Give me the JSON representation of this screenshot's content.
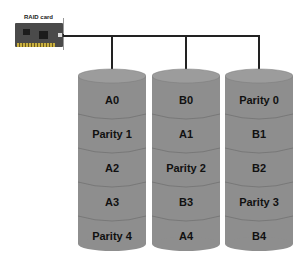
{
  "raid_card": {
    "label": "RAID card"
  },
  "colors": {
    "disk_fill": "#8e8e8e",
    "disk_top": "#9a9a9a",
    "line": "#222222"
  },
  "disks": [
    {
      "blocks": [
        "A0",
        "Parity 1",
        "A2",
        "A3",
        "Parity 4"
      ]
    },
    {
      "blocks": [
        "B0",
        "A1",
        "Parity 2",
        "B3",
        "A4"
      ]
    },
    {
      "blocks": [
        "Parity 0",
        "B1",
        "B2",
        "Parity 3",
        "B4"
      ]
    }
  ]
}
